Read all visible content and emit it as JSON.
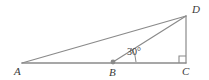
{
  "figure": {
    "type": "geometry-diagram",
    "width": 209,
    "height": 80,
    "background_color": "#ffffff",
    "line_color": "#8a8a8a",
    "text_color": "#3a3a3a"
  },
  "points": {
    "A": {
      "label": "A",
      "x": 22,
      "y": 63
    },
    "B": {
      "label": "B",
      "x": 113,
      "y": 62
    },
    "C": {
      "label": "C",
      "x": 186,
      "y": 63
    },
    "D": {
      "label": "D",
      "x": 186,
      "y": 16
    }
  },
  "segments": [
    {
      "name": "A-D",
      "from": "A",
      "to": "D"
    },
    {
      "name": "A-C",
      "from": "A",
      "to": "C"
    },
    {
      "name": "B-D",
      "from": "B",
      "to": "D"
    },
    {
      "name": "D-C",
      "from": "D",
      "to": "C"
    }
  ],
  "markers": {
    "right_angle_at_C": {
      "vertex": "C",
      "size": 7
    },
    "point_dot_at_B": {
      "vertex": "B",
      "radius": 2.4
    }
  },
  "angles": [
    {
      "name": "angle-DBC",
      "vertex": "B",
      "value": "30°",
      "radius": 23
    }
  ]
}
